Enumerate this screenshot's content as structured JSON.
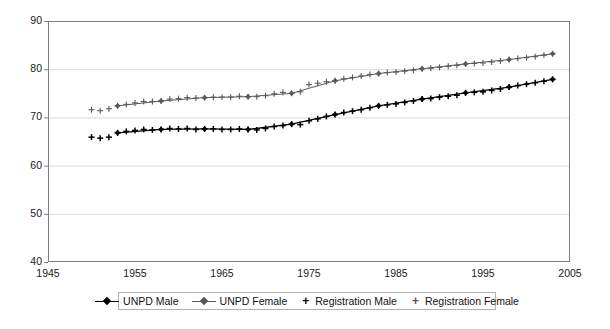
{
  "chart_data": {
    "type": "line",
    "title": "",
    "subtitle": "",
    "xlabel": "",
    "ylabel": "",
    "xlim": [
      1945,
      2005
    ],
    "ylim": [
      40,
      90
    ],
    "xticks": [
      1945,
      1955,
      1965,
      1975,
      1985,
      1995,
      2005
    ],
    "yticks": [
      40,
      50,
      60,
      70,
      80,
      90
    ],
    "xtick_labels": [
      "1945",
      "1955",
      "1965",
      "1975",
      "1985",
      "1995",
      "2005"
    ],
    "ytick_labels": [
      "40",
      "50",
      "60",
      "70",
      "80",
      "90"
    ],
    "grid": "horizontal",
    "legend_position": "bottom",
    "series": [
      {
        "name": "UNPD Male",
        "marker": "diamond",
        "line": true,
        "color": "#000000",
        "x": [
          1953,
          1958,
          1963,
          1968,
          1973,
          1978,
          1983,
          1988,
          1993,
          1998,
          2003
        ],
        "values": [
          66.8,
          67.5,
          67.6,
          67.5,
          68.6,
          70.6,
          72.4,
          73.8,
          75.1,
          76.3,
          77.9
        ]
      },
      {
        "name": "UNPD Female",
        "marker": "diamond",
        "line": true,
        "color": "#595959",
        "x": [
          1953,
          1958,
          1963,
          1968,
          1973,
          1978,
          1983,
          1988,
          1993,
          1998,
          2003
        ],
        "values": [
          72.4,
          73.4,
          74.1,
          74.3,
          75.0,
          77.6,
          79.1,
          80.1,
          81.1,
          82.0,
          83.2
        ]
      },
      {
        "name": "Registration Male",
        "marker": "plus",
        "line": false,
        "color": "#000000",
        "x": [
          1950,
          1951,
          1952,
          1953,
          1954,
          1955,
          1956,
          1957,
          1958,
          1959,
          1960,
          1961,
          1962,
          1963,
          1964,
          1965,
          1966,
          1967,
          1968,
          1969,
          1970,
          1971,
          1972,
          1973,
          1974,
          1975,
          1976,
          1977,
          1978,
          1979,
          1980,
          1981,
          1982,
          1983,
          1984,
          1985,
          1986,
          1987,
          1988,
          1989,
          1990,
          1991,
          1992,
          1993,
          1994,
          1995,
          1996,
          1997,
          1998,
          1999,
          2000,
          2001,
          2002,
          2003
        ],
        "values": [
          65.9,
          65.7,
          65.9,
          66.8,
          67.1,
          67.3,
          67.5,
          67.4,
          67.5,
          67.7,
          67.6,
          67.7,
          67.5,
          67.6,
          67.6,
          67.5,
          67.5,
          67.6,
          67.5,
          67.4,
          67.7,
          68.1,
          68.3,
          68.6,
          68.5,
          69.3,
          69.7,
          70.2,
          70.6,
          71.0,
          71.3,
          71.6,
          72.0,
          72.4,
          72.6,
          72.8,
          73.1,
          73.4,
          73.8,
          73.9,
          74.2,
          74.4,
          74.6,
          75.1,
          75.2,
          75.3,
          75.6,
          75.9,
          76.3,
          76.6,
          76.9,
          77.2,
          77.5,
          77.9
        ]
      },
      {
        "name": "Registration Female",
        "marker": "plus",
        "line": false,
        "color": "#5a5a5a",
        "x": [
          1950,
          1951,
          1952,
          1953,
          1954,
          1955,
          1956,
          1957,
          1958,
          1959,
          1960,
          1961,
          1962,
          1963,
          1964,
          1965,
          1966,
          1967,
          1968,
          1969,
          1970,
          1971,
          1972,
          1973,
          1974,
          1975,
          1976,
          1977,
          1978,
          1979,
          1980,
          1981,
          1982,
          1983,
          1984,
          1985,
          1986,
          1987,
          1988,
          1989,
          1990,
          1991,
          1992,
          1993,
          1994,
          1995,
          1996,
          1997,
          1998,
          1999,
          2000,
          2001,
          2002,
          2003
        ],
        "values": [
          71.6,
          71.4,
          71.8,
          72.4,
          72.7,
          73.0,
          73.3,
          73.3,
          73.4,
          73.8,
          73.9,
          74.1,
          74.0,
          74.1,
          74.2,
          74.2,
          74.2,
          74.4,
          74.3,
          74.3,
          74.5,
          74.9,
          75.2,
          75.0,
          75.3,
          76.8,
          77.1,
          77.4,
          77.6,
          78.0,
          78.3,
          78.6,
          78.9,
          79.1,
          79.3,
          79.4,
          79.6,
          79.8,
          80.1,
          80.2,
          80.4,
          80.6,
          80.8,
          81.1,
          81.2,
          81.3,
          81.5,
          81.7,
          82.0,
          82.2,
          82.4,
          82.6,
          82.9,
          83.2
        ]
      }
    ]
  },
  "legend": {
    "items": [
      {
        "label": "UNPD Male",
        "marker": "line-diamond",
        "color": "#000000"
      },
      {
        "label": "UNPD Female",
        "marker": "line-diamond",
        "color": "#595959"
      },
      {
        "label": "Registration Male",
        "marker": "plus",
        "color": "#000000"
      },
      {
        "label": "Registration Female",
        "marker": "plus",
        "color": "#5a5a5a"
      }
    ]
  },
  "plot_area": {
    "left": 48,
    "right": 570,
    "top": 21,
    "bottom": 262,
    "border_color": "#7f7f7f",
    "gridline_color": "#d9d9d9",
    "background": "#ffffff"
  }
}
